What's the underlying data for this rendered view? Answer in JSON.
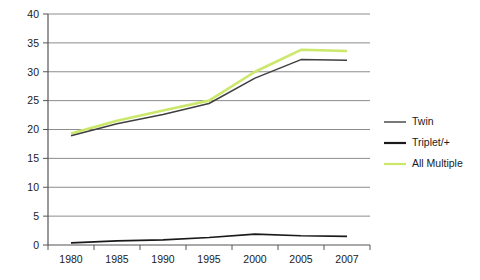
{
  "chart_data": {
    "type": "line",
    "title": "",
    "subtitle": "",
    "xlabel": "",
    "ylabel": "",
    "categories": [
      "1980",
      "1985",
      "1990",
      "1995",
      "2000",
      "2005",
      "2007"
    ],
    "x": [
      1980,
      1985,
      1990,
      1995,
      2000,
      2005,
      2007
    ],
    "ylim": [
      0,
      40
    ],
    "yticks": [
      0,
      5,
      10,
      15,
      20,
      25,
      30,
      35,
      40
    ],
    "ytick_labels": [
      "0",
      "5",
      "10",
      "15",
      "20",
      "25",
      "30",
      "35",
      "40"
    ],
    "grid": true,
    "grid_axis": "y",
    "legend_position": "right",
    "series": [
      {
        "name": "Twin",
        "color": "#3f3f3f",
        "values": [
          18.9,
          21.0,
          22.6,
          24.5,
          28.9,
          32.1,
          32.0
        ]
      },
      {
        "name": "Triplet/+",
        "color": "#1a1a1a",
        "values": [
          0.37,
          0.7,
          0.9,
          1.3,
          1.9,
          1.6,
          1.5
        ]
      },
      {
        "name": "All Multiple",
        "color": "#cbe86b",
        "values": [
          19.3,
          21.5,
          23.3,
          25.0,
          30.0,
          33.8,
          33.6
        ]
      }
    ]
  },
  "legend": {
    "entries": [
      {
        "label": "Twin",
        "color": "#3f3f3f",
        "width": 1.4
      },
      {
        "label": "Triplet/+",
        "color": "#1a1a1a",
        "width": 2.2
      },
      {
        "label": "All Multiple",
        "color": "#cbe86b",
        "width": 2.2
      }
    ]
  },
  "axes": {
    "y_axis_color": "#555555",
    "x_axis_color": "#555555",
    "grid_color": "#8c8c8c",
    "background": "#ffffff"
  }
}
